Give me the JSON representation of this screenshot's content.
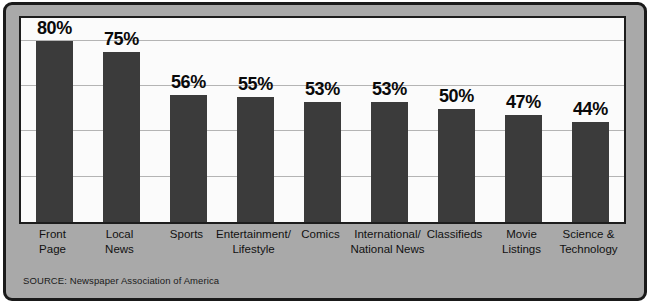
{
  "chart_data": {
    "type": "bar",
    "title": "",
    "subtitle": "",
    "xlabel": "",
    "ylabel": "",
    "ylim": [
      0,
      90
    ],
    "grid": true,
    "gridlines": [
      20,
      40,
      60,
      80
    ],
    "legend": "none",
    "categories": [
      "Front\nPage",
      "Local\nNews",
      "Sports",
      "Entertainment/\nLifestyle",
      "Comics",
      "International/\nNational News",
      "Classifieds",
      "Movie\nListings",
      "Science &\nTechnology"
    ],
    "category_lines": [
      [
        "Front",
        "Page"
      ],
      [
        "Local",
        "News"
      ],
      [
        "Sports"
      ],
      [
        "Entertainment/",
        "Lifestyle"
      ],
      [
        "Comics"
      ],
      [
        "International/",
        "National News"
      ],
      [
        "Classifieds"
      ],
      [
        "Movie",
        "Listings"
      ],
      [
        "Science &",
        "Technology"
      ]
    ],
    "values": [
      80,
      75,
      56,
      55,
      53,
      53,
      50,
      47,
      44
    ],
    "value_labels": [
      "80%",
      "75%",
      "56%",
      "55%",
      "53%",
      "53%",
      "50%",
      "47%",
      "44%"
    ],
    "bar_color": "#3b3b3b",
    "plot_background": "#fbfbfb",
    "panel_background": "#a9a9a9",
    "border_color": "#1a1a1a",
    "gridline_color": "#b4b4b4"
  },
  "source": {
    "text": "SOURCE: Newspaper Association of America"
  }
}
